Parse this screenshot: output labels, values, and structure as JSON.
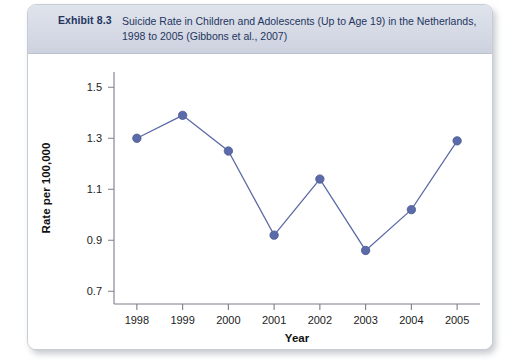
{
  "exhibit": {
    "number_label": "Exhibit 8.3",
    "caption": "Suicide Rate in Children and Adolescents (Up to Age 19) in the Netherlands, 1998 to 2005 (Gibbons et al., 2007)"
  },
  "colors": {
    "header_band": "#d6dae5",
    "header_text": "#23355f",
    "marker": "#5b6aa8",
    "line": "#5d6ba6",
    "axis": "#7a7f8a",
    "card_border": "#c8ccd4"
  },
  "chart_data": {
    "type": "line",
    "title": "Suicide Rate in Children and Adolescents (Up to Age 19) in the Netherlands, 1998 to 2005 (Gibbons et al., 2007)",
    "xlabel": "Year",
    "ylabel": "Rate per 100,000",
    "categories": [
      "1998",
      "1999",
      "2000",
      "2001",
      "2002",
      "2003",
      "2004",
      "2005"
    ],
    "x": [
      1998,
      1999,
      2000,
      2001,
      2002,
      2003,
      2004,
      2005
    ],
    "values": [
      1.3,
      1.39,
      1.25,
      0.92,
      1.14,
      0.86,
      1.02,
      1.29
    ],
    "series": [
      {
        "name": "Suicide rate per 100,000",
        "values": [
          1.3,
          1.39,
          1.25,
          0.92,
          1.14,
          0.86,
          1.02,
          1.29
        ]
      }
    ],
    "xlim": [
      1997.5,
      2005.5
    ],
    "ylim": [
      0.65,
      1.56
    ],
    "yticks": [
      0.7,
      0.9,
      1.1,
      1.3,
      1.5
    ],
    "ytick_labels": [
      "0.7",
      "0.9",
      "1.1",
      "1.3",
      "1.5"
    ],
    "xticks": [
      1998,
      1999,
      2000,
      2001,
      2002,
      2003,
      2004,
      2005
    ],
    "xtick_labels": [
      "1998",
      "1999",
      "2000",
      "2001",
      "2002",
      "2003",
      "2004",
      "2005"
    ],
    "grid": false,
    "legend": false,
    "markers": "circle"
  }
}
